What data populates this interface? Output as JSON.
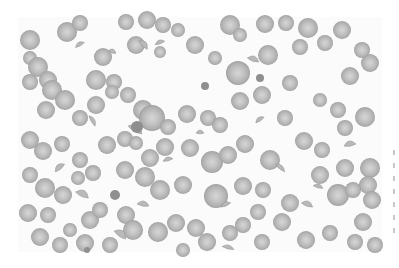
{
  "image": {
    "subject": "peripheral blood smear micrograph with red blood cells and fragmented cells",
    "frame": {
      "x": 18,
      "y": 17,
      "width": 364,
      "height": 235
    },
    "colors": {
      "background": "#ffffff",
      "field": "#fbfbfb",
      "cell_fill": "#b9b9b9",
      "cell_center": "#d4d4d4",
      "cell_edge": "#9a9a9a",
      "dense_cell": "#8f8f8f"
    }
  },
  "cells": [
    [
      30,
      40,
      10
    ],
    [
      67,
      32,
      10
    ],
    [
      80,
      23,
      8
    ],
    [
      126,
      22,
      8
    ],
    [
      147,
      20,
      9
    ],
    [
      163,
      25,
      8
    ],
    [
      178,
      30,
      7
    ],
    [
      30,
      58,
      7
    ],
    [
      38,
      67,
      10
    ],
    [
      48,
      80,
      9
    ],
    [
      30,
      82,
      8
    ],
    [
      96,
      80,
      10
    ],
    [
      114,
      82,
      8
    ],
    [
      128,
      95,
      8
    ],
    [
      160,
      52,
      6
    ],
    [
      136,
      45,
      9
    ],
    [
      103,
      57,
      9
    ],
    [
      195,
      45,
      9
    ],
    [
      230,
      25,
      10
    ],
    [
      240,
      35,
      7
    ],
    [
      265,
      24,
      9
    ],
    [
      286,
      23,
      8
    ],
    [
      308,
      28,
      10
    ],
    [
      215,
      58,
      7
    ],
    [
      268,
      55,
      10
    ],
    [
      238,
      73,
      12
    ],
    [
      300,
      47,
      8
    ],
    [
      325,
      43,
      8
    ],
    [
      342,
      30,
      9
    ],
    [
      350,
      76,
      9
    ],
    [
      370,
      63,
      9
    ],
    [
      362,
      50,
      8
    ],
    [
      52,
      90,
      10
    ],
    [
      65,
      100,
      10
    ],
    [
      46,
      110,
      9
    ],
    [
      80,
      118,
      8
    ],
    [
      96,
      105,
      9
    ],
    [
      112,
      92,
      7
    ],
    [
      143,
      110,
      10
    ],
    [
      152,
      118,
      13
    ],
    [
      168,
      127,
      8
    ],
    [
      187,
      114,
      9
    ],
    [
      208,
      118,
      8
    ],
    [
      220,
      125,
      8
    ],
    [
      240,
      101,
      9
    ],
    [
      262,
      95,
      9
    ],
    [
      290,
      83,
      8
    ],
    [
      320,
      100,
      7
    ],
    [
      338,
      110,
      8
    ],
    [
      365,
      117,
      10
    ],
    [
      30,
      140,
      9
    ],
    [
      43,
      151,
      9
    ],
    [
      62,
      144,
      8
    ],
    [
      80,
      160,
      8
    ],
    [
      107,
      145,
      9
    ],
    [
      125,
      139,
      8
    ],
    [
      136,
      143,
      7
    ],
    [
      150,
      158,
      9
    ],
    [
      165,
      147,
      9
    ],
    [
      190,
      148,
      9
    ],
    [
      212,
      162,
      11
    ],
    [
      228,
      155,
      9
    ],
    [
      245,
      144,
      9
    ],
    [
      270,
      160,
      10
    ],
    [
      304,
      141,
      9
    ],
    [
      322,
      150,
      8
    ],
    [
      345,
      168,
      9
    ],
    [
      370,
      168,
      10
    ],
    [
      368,
      185,
      9
    ],
    [
      372,
      200,
      9
    ],
    [
      363,
      222,
      9
    ],
    [
      375,
      245,
      8
    ],
    [
      30,
      175,
      8
    ],
    [
      45,
      188,
      10
    ],
    [
      63,
      195,
      9
    ],
    [
      78,
      178,
      7
    ],
    [
      93,
      173,
      8
    ],
    [
      125,
      170,
      9
    ],
    [
      145,
      177,
      10
    ],
    [
      160,
      190,
      10
    ],
    [
      183,
      185,
      9
    ],
    [
      216,
      196,
      12
    ],
    [
      243,
      186,
      9
    ],
    [
      263,
      190,
      8
    ],
    [
      290,
      203,
      9
    ],
    [
      320,
      175,
      9
    ],
    [
      338,
      195,
      11
    ],
    [
      353,
      190,
      8
    ],
    [
      28,
      213,
      9
    ],
    [
      48,
      215,
      8
    ],
    [
      90,
      220,
      9
    ],
    [
      100,
      210,
      8
    ],
    [
      126,
      215,
      9
    ],
    [
      133,
      230,
      10
    ],
    [
      158,
      232,
      10
    ],
    [
      176,
      223,
      9
    ],
    [
      196,
      228,
      9
    ],
    [
      207,
      242,
      9
    ],
    [
      230,
      233,
      8
    ],
    [
      243,
      225,
      8
    ],
    [
      262,
      242,
      8
    ],
    [
      282,
      222,
      9
    ],
    [
      306,
      240,
      9
    ],
    [
      330,
      233,
      8
    ],
    [
      355,
      242,
      8
    ],
    [
      40,
      237,
      9
    ],
    [
      60,
      245,
      8
    ],
    [
      85,
      243,
      9
    ],
    [
      110,
      245,
      8
    ],
    [
      70,
      230,
      7
    ],
    [
      183,
      250,
      7
    ],
    [
      258,
      212,
      8
    ],
    [
      345,
      128,
      8
    ],
    [
      285,
      118,
      8
    ]
  ],
  "fragments": [
    [
      80,
      45,
      5,
      3,
      -30
    ],
    [
      112,
      52,
      4,
      3,
      20
    ],
    [
      143,
      45,
      6,
      4,
      45
    ],
    [
      160,
      43,
      5,
      3,
      -20
    ],
    [
      92,
      121,
      6,
      3,
      60
    ],
    [
      135,
      130,
      8,
      5,
      30
    ],
    [
      60,
      168,
      6,
      4,
      -40
    ],
    [
      82,
      195,
      7,
      5,
      25
    ],
    [
      143,
      205,
      6,
      4,
      10
    ],
    [
      168,
      160,
      5,
      3,
      -15
    ],
    [
      253,
      60,
      6,
      4,
      20
    ],
    [
      260,
      120,
      5,
      3,
      -35
    ],
    [
      280,
      168,
      6,
      3,
      40
    ],
    [
      318,
      187,
      5,
      3,
      15
    ],
    [
      350,
      145,
      6,
      4,
      -10
    ],
    [
      120,
      235,
      7,
      5,
      35
    ],
    [
      226,
      205,
      5,
      3,
      -25
    ],
    [
      307,
      205,
      6,
      4,
      20
    ],
    [
      200,
      133,
      4,
      3,
      0
    ],
    [
      228,
      248,
      6,
      3,
      15
    ]
  ],
  "dense_cells": [
    [
      137,
      127,
      6
    ],
    [
      115,
      195,
      5
    ],
    [
      260,
      78,
      4
    ],
    [
      205,
      86,
      4
    ],
    [
      87,
      250,
      3
    ]
  ]
}
